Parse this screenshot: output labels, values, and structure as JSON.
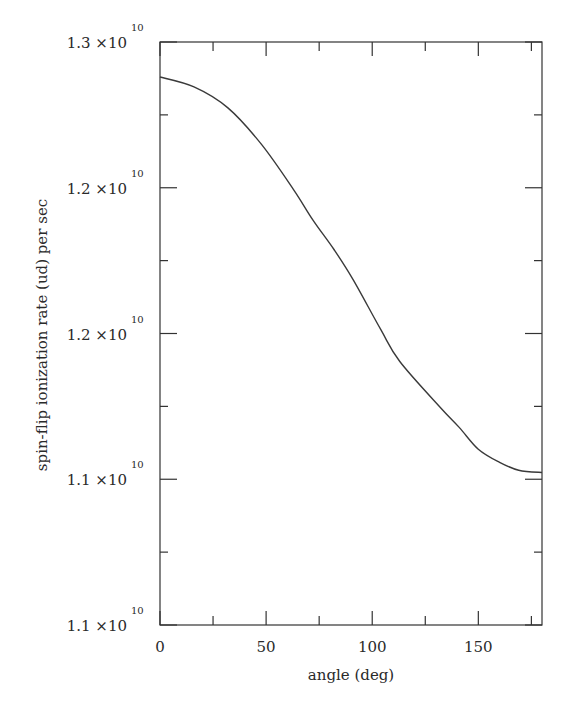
{
  "chart_data": {
    "type": "line",
    "title": "",
    "xlabel": "angle (deg)",
    "ylabel": "spin-flip ionization rate (ud) per sec",
    "xlim": [
      0,
      180
    ],
    "ylim": [
      11000000000.0,
      13000000000.0
    ],
    "grid": false,
    "legend": null,
    "x_ticks": [
      {
        "value": 0,
        "label": "0"
      },
      {
        "value": 50,
        "label": "50"
      },
      {
        "value": 100,
        "label": "100"
      },
      {
        "value": 150,
        "label": "150"
      }
    ],
    "x_minor_ticks": [
      25,
      75,
      125,
      175
    ],
    "y_ticks": [
      {
        "value": 13000000000.0,
        "mantissa": "1.3 ×10",
        "exponent": "10"
      },
      {
        "value": 12500000000.0,
        "mantissa": "1.2 ×10",
        "exponent": "10"
      },
      {
        "value": 12000000000.0,
        "mantissa": "1.2 ×10",
        "exponent": "10"
      },
      {
        "value": 11500000000.0,
        "mantissa": "1.1 ×10",
        "exponent": "10"
      },
      {
        "value": 11000000000.0,
        "mantissa": "1.1 ×10",
        "exponent": "10"
      }
    ],
    "y_minor_ticks": [
      12750000000.0,
      12250000000.0,
      11750000000.0,
      11250000000.0
    ],
    "series": [
      {
        "name": "spin-flip ionization rate (ud)",
        "color": "#3a3a3a",
        "x": [
          0,
          16,
          32,
          48,
          63,
          72,
          82,
          91,
          104,
          113,
          132,
          141,
          150,
          160,
          169,
          180
        ],
        "y": [
          12880000000.0,
          12846000000.0,
          12774000000.0,
          12647000000.0,
          12493000000.0,
          12390000000.0,
          12288000000.0,
          12185000000.0,
          12014000000.0,
          11904000000.0,
          11747000000.0,
          11678000000.0,
          11603000000.0,
          11558000000.0,
          11531000000.0,
          11523000000.0
        ]
      }
    ]
  },
  "colors": {
    "background": "#ffffff",
    "axis": "#333333",
    "text": "#2a2a2a"
  }
}
